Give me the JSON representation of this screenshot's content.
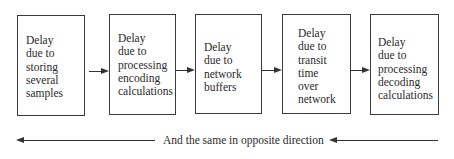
{
  "diagram": {
    "type": "flowchart",
    "boxes": [
      {
        "id": "storing",
        "label": "Delay\ndue to\nstoring\nseveral\nsamples"
      },
      {
        "id": "encoding",
        "label": "Delay\ndue to\nprocessing\nencoding\ncalculations"
      },
      {
        "id": "network-buffers",
        "label": "Delay\ndue to\nnetwork\nbuffers"
      },
      {
        "id": "transit",
        "label": "Delay\ndue to\ntransit\ntime\nover\nnetwork"
      },
      {
        "id": "decoding",
        "label": "Delay\ndue to\nprocessing\ndecoding\ncalculations"
      }
    ],
    "flow_arrows": [
      {
        "from": "storing",
        "to": "encoding"
      },
      {
        "from": "encoding",
        "to": "network-buffers"
      },
      {
        "from": "network-buffers",
        "to": "transit"
      },
      {
        "from": "transit",
        "to": "decoding"
      }
    ],
    "return_caption": "And the same in opposite direction",
    "return_direction": "right-to-left"
  }
}
